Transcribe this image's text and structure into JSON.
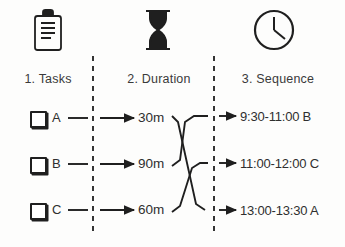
{
  "diagram": {
    "background_color": "#fdfdfc",
    "ink_color": "#2a2a2a"
  },
  "columns": [
    {
      "id": "tasks",
      "header": "1. Tasks",
      "icon": "clipboard-icon"
    },
    {
      "id": "duration",
      "header": "2. Duration",
      "icon": "hourglass-icon"
    },
    {
      "id": "sequence",
      "header": "3. Sequence",
      "icon": "clock-icon"
    }
  ],
  "tasks": [
    {
      "label": "A",
      "checked": false
    },
    {
      "label": "B",
      "checked": false
    },
    {
      "label": "C",
      "checked": false
    }
  ],
  "durations": [
    {
      "label": "30m"
    },
    {
      "label": "90m"
    },
    {
      "label": "60m"
    }
  ],
  "sequence": [
    {
      "label": "9:30-11:00 B"
    },
    {
      "label": "11:00-12:00 C"
    },
    {
      "label": "13:00-13:30 A"
    }
  ],
  "mapping": {
    "description": "duration row index to sequence row index",
    "links": [
      {
        "from_duration": 0,
        "to_sequence": 2
      },
      {
        "from_duration": 1,
        "to_sequence": 0
      },
      {
        "from_duration": 2,
        "to_sequence": 1
      }
    ]
  }
}
